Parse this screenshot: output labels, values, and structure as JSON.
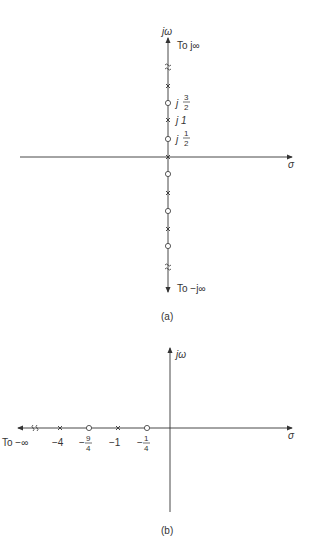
{
  "figure_a": {
    "caption": "(a)",
    "vertical_axis_label": "jω",
    "horizontal_axis_label": "σ",
    "top_annotation": "To j∞",
    "bottom_annotation": "To −j∞",
    "labels": {
      "j3_2": {
        "prefix": "j",
        "num": "3",
        "den": "2"
      },
      "j1": "j 1",
      "j1_2": {
        "prefix": "j",
        "num": "1",
        "den": "2"
      }
    },
    "markers_above": [
      "break",
      "pole",
      "zero",
      "pole",
      "zero",
      "pole-origin"
    ],
    "markers_below": [
      "zero",
      "pole",
      "zero",
      "pole",
      "zero",
      "break"
    ]
  },
  "figure_b": {
    "caption": "(b)",
    "vertical_axis_label": "jω",
    "horizontal_axis_label": "σ",
    "left_annotation": "To −∞",
    "tick_labels": {
      "m4": "−4",
      "m9_4": {
        "sign": "−",
        "num": "9",
        "den": "4"
      },
      "m1": "−1",
      "m1_4": {
        "sign": "−",
        "num": "1",
        "den": "4"
      }
    },
    "markers": [
      "break",
      "pole",
      "zero",
      "pole",
      "zero"
    ]
  }
}
